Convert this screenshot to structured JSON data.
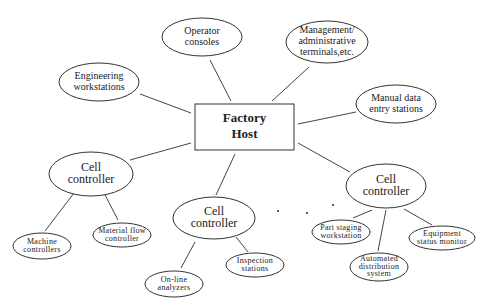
{
  "diagram": {
    "host": {
      "id": "factory-host",
      "lines": [
        "Factory",
        "Host"
      ]
    },
    "nodes": [
      {
        "id": "operator-consoles",
        "lines": [
          "Operator",
          "consoles"
        ]
      },
      {
        "id": "management-terminals",
        "lines": [
          "Management/",
          "administrative",
          "terminals,etc."
        ]
      },
      {
        "id": "engineering-workstations",
        "lines": [
          "Engineering",
          "workstations"
        ]
      },
      {
        "id": "manual-data-entry",
        "lines": [
          "Manual data",
          "entry stations"
        ]
      },
      {
        "id": "cell-controller-left",
        "lines": [
          "Cell",
          "controller"
        ]
      },
      {
        "id": "cell-controller-middle",
        "lines": [
          "Cell",
          "controller"
        ]
      },
      {
        "id": "cell-controller-right",
        "lines": [
          "Cell",
          "controller"
        ]
      },
      {
        "id": "machine-controllers",
        "lines": [
          "Machine",
          "controllers"
        ]
      },
      {
        "id": "material-flow-controller",
        "lines": [
          "Material flow",
          "controller"
        ]
      },
      {
        "id": "on-line-analyzers",
        "lines": [
          "On-line",
          "analyzers"
        ]
      },
      {
        "id": "inspection-stations",
        "lines": [
          "Inspection",
          "stations"
        ]
      },
      {
        "id": "part-staging-workstation",
        "lines": [
          "Part staging",
          "workstation"
        ]
      },
      {
        "id": "automated-distribution-system",
        "lines": [
          "Automated",
          "distribution",
          "system"
        ]
      },
      {
        "id": "equipment-status-monitor",
        "lines": [
          "Equipment",
          "status monitor"
        ]
      }
    ],
    "edges": [
      [
        "factory-host",
        "operator-consoles"
      ],
      [
        "factory-host",
        "management-terminals"
      ],
      [
        "factory-host",
        "engineering-workstations"
      ],
      [
        "factory-host",
        "manual-data-entry"
      ],
      [
        "factory-host",
        "cell-controller-left"
      ],
      [
        "factory-host",
        "cell-controller-middle"
      ],
      [
        "factory-host",
        "cell-controller-right"
      ],
      [
        "cell-controller-left",
        "machine-controllers"
      ],
      [
        "cell-controller-left",
        "material-flow-controller"
      ],
      [
        "cell-controller-middle",
        "on-line-analyzers"
      ],
      [
        "cell-controller-middle",
        "inspection-stations"
      ],
      [
        "cell-controller-right",
        "part-staging-workstation"
      ],
      [
        "cell-controller-right",
        "automated-distribution-system"
      ],
      [
        "cell-controller-right",
        "equipment-status-monitor"
      ]
    ],
    "ellipsis": "more cell controllers"
  }
}
